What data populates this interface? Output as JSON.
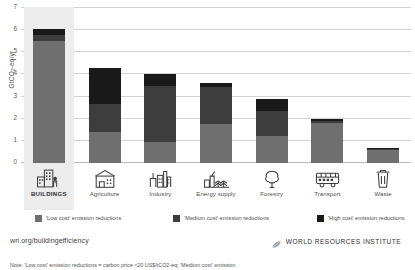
{
  "chart_data": {
    "type": "bar",
    "stacked": true,
    "title": "",
    "xlabel": "",
    "ylabel": "GtCO2-eq/yr",
    "ylim": [
      0,
      7
    ],
    "yticks": [
      0,
      1,
      2,
      3,
      4,
      5,
      6,
      7
    ],
    "grid": true,
    "legend_position": "bottom",
    "categories": [
      "BUILDINGS",
      "Agriculture",
      "Industry",
      "Energy supply",
      "Forestry",
      "Transport",
      "Waste"
    ],
    "highlighted_category": "BUILDINGS",
    "series": [
      {
        "name": "'Low cost' emission reductions",
        "color": "#6f6f6f",
        "values": [
          5.5,
          1.4,
          0.95,
          1.75,
          1.2,
          1.8,
          0.6
        ]
      },
      {
        "name": "'Medium cost' emission reductions",
        "color": "#3d3d3d",
        "values": [
          0.3,
          1.25,
          2.55,
          1.7,
          1.15,
          0.1,
          0.05
        ]
      },
      {
        "name": "'High cost' emission reductions",
        "color": "#191919",
        "values": [
          0.25,
          1.65,
          0.5,
          0.15,
          0.55,
          0.1,
          0.05
        ]
      }
    ],
    "totals": [
      6.05,
      4.3,
      4.0,
      3.6,
      2.9,
      2.0,
      0.7
    ]
  },
  "axis": {
    "y_label_main": "GtCO",
    "y_label_sub": "2",
    "y_label_tail": "-eq/yr",
    "ticks": [
      "7",
      "6",
      "5",
      "4",
      "3",
      "2",
      "1",
      "0"
    ]
  },
  "categories": [
    {
      "label": "BUILDINGS",
      "icon": "buildings-icon",
      "featured": true
    },
    {
      "label": "Agriculture",
      "icon": "agriculture-icon",
      "featured": false
    },
    {
      "label": "Industry",
      "icon": "industry-icon",
      "featured": false
    },
    {
      "label": "Energy supply",
      "icon": "energy-supply-icon",
      "featured": false
    },
    {
      "label": "Forestry",
      "icon": "forestry-icon",
      "featured": false
    },
    {
      "label": "Transport",
      "icon": "transport-icon",
      "featured": false
    },
    {
      "label": "Waste",
      "icon": "waste-icon",
      "featured": false
    }
  ],
  "legend": [
    {
      "label": "'Low cost' emission reductions",
      "color": "#6f6f6f"
    },
    {
      "label": "'Medium cost' emission reductions",
      "color": "#3d3d3d"
    },
    {
      "label": "'High cost' emission reductions",
      "color": "#191919"
    }
  ],
  "footer": {
    "url": "wri.org/buildingefficiency",
    "org_name": "WORLD RESOURCES INSTITUTE",
    "org_mark": "wri-leaf-logo"
  },
  "note": {
    "text": "Note: 'Low cost' emission reductions = carbon price <20 US$/tCO2-eq; 'Medium cost' emission"
  },
  "colors": {
    "low": "#6f6f6f",
    "medium": "#3d3d3d",
    "high": "#191919",
    "highlight_band": "#ececec",
    "gridline": "#d2d2d2"
  }
}
